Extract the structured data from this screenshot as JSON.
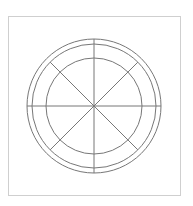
{
  "diagram": {
    "type": "concentric-circles-with-radial-spokes",
    "frame": {
      "x": 8,
      "y": 16,
      "width": 172,
      "height": 179,
      "stroke": "#cfcfcf"
    },
    "center": {
      "x": 94,
      "y": 106
    },
    "circles": [
      {
        "name": "outer",
        "r": 67
      },
      {
        "name": "middle",
        "r": 62
      },
      {
        "name": "inner",
        "r": 48
      }
    ],
    "spokes": {
      "axis_length": 67,
      "diagonal_length": 62,
      "angles_deg": [
        0,
        45,
        90,
        135,
        180,
        225,
        270,
        315
      ]
    },
    "stroke_color": "#777777",
    "stroke_width": 1
  }
}
